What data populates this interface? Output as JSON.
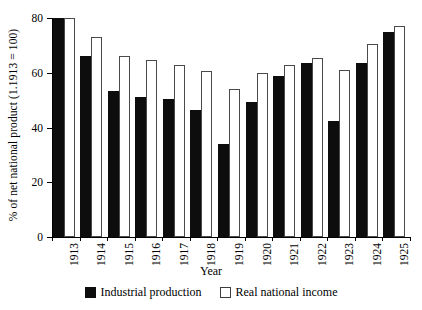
{
  "chart_data": {
    "type": "bar",
    "title": "",
    "xlabel": "Year",
    "ylabel": "% of net national product (1.1913 = 100)",
    "categories": [
      "1913",
      "1914",
      "1915",
      "1916",
      "1917",
      "1918",
      "1919",
      "1920",
      "1921",
      "1922",
      "1923",
      "1924",
      "1925"
    ],
    "series": [
      {
        "name": "Industrial production",
        "color": "#0d0d0d",
        "values": [
          80,
          66,
          53.5,
          51,
          50.5,
          46.5,
          34,
          49.5,
          59,
          63.5,
          42.5,
          63.5,
          75
        ]
      },
      {
        "name": "Real national income",
        "color": "#ffffff",
        "values": [
          80,
          73,
          66,
          64.5,
          63,
          60.5,
          54,
          60,
          63,
          65.5,
          61,
          70.5,
          77
        ]
      }
    ],
    "ylim": [
      0,
      80
    ],
    "yticks": [
      0,
      20,
      40,
      60,
      80
    ],
    "ytick_labels": [
      "0",
      "20",
      "40",
      "60",
      "80"
    ],
    "grid": false,
    "legend_position": "bottom"
  }
}
